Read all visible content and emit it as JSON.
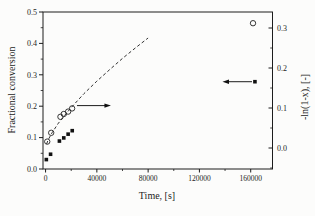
{
  "figure": {
    "x_axis_title": "Time, [s]",
    "left_axis_title": "Fractional conversion",
    "right_axis_title": "-ln(1-x), [-]"
  },
  "colors": {
    "ink": "#1c1c1c",
    "background": "#fcfcfb"
  },
  "chart_data": {
    "type": "scatter",
    "title": "",
    "xlabel": "Time, [s]",
    "ylabel_left": "Fractional conversion",
    "ylabel_right": "-ln(1-x), [-]",
    "grid": false,
    "legend": "none",
    "xlim": [
      -2000,
      177000
    ],
    "ylim_left": [
      0,
      0.5
    ],
    "ylim_right": [
      -0.0525,
      0.34
    ],
    "x_ticks": [
      0,
      40000,
      80000,
      120000,
      160000
    ],
    "x_tick_labels": [
      "0",
      "40000",
      "80000",
      "120000",
      "160000"
    ],
    "x_minor_ticks": [
      20000,
      60000,
      100000,
      140000
    ],
    "left_ticks": [
      0.0,
      0.1,
      0.2,
      0.3,
      0.4,
      0.5
    ],
    "left_tick_labels": [
      "0.0",
      "0.1",
      "0.2",
      "0.3",
      "0.4",
      "0.5"
    ],
    "left_minor_ticks": [
      0.05,
      0.15,
      0.25,
      0.35,
      0.45
    ],
    "right_ticks": [
      0.0,
      0.1,
      0.2,
      0.3
    ],
    "right_tick_labels": [
      "0.0",
      "0.1",
      "0.2",
      "0.3"
    ],
    "right_minor_ticks": [
      -0.05,
      0.05,
      0.15,
      0.25
    ],
    "series": [
      {
        "name": "fractional-conversion-squares",
        "marker": "filled-square",
        "axis": "left",
        "points": [
          [
            600,
            0.03
          ],
          [
            3900,
            0.047
          ],
          [
            10800,
            0.089
          ],
          [
            14200,
            0.099
          ],
          [
            17600,
            0.111
          ],
          [
            20800,
            0.122
          ],
          [
            163300,
            0.278
          ]
        ]
      },
      {
        "name": "minus-ln-one-minus-x-circles",
        "marker": "open-circle",
        "axis": "right",
        "points": [
          [
            1300,
            0.016
          ],
          [
            4400,
            0.038
          ],
          [
            11600,
            0.078
          ],
          [
            14200,
            0.085
          ],
          [
            17600,
            0.091
          ],
          [
            20700,
            0.099
          ],
          [
            161800,
            0.312
          ]
        ]
      }
    ],
    "fit_line": {
      "name": "dashed-model-fit",
      "style": "dashed",
      "axis": "right",
      "points": [
        [
          800,
          0.01
        ],
        [
          2000,
          0.02
        ],
        [
          5000,
          0.038
        ],
        [
          10000,
          0.062
        ],
        [
          15000,
          0.082
        ],
        [
          20000,
          0.101
        ],
        [
          30000,
          0.136
        ],
        [
          40000,
          0.167
        ],
        [
          50000,
          0.196
        ],
        [
          60000,
          0.224
        ],
        [
          70000,
          0.25
        ],
        [
          80000,
          0.275
        ]
      ]
    },
    "annotations": [
      {
        "type": "arrow",
        "name": "circles-read-right-axis",
        "axis": "right",
        "value": 0.106,
        "tail_t": 24500,
        "tip_t": 51000,
        "direction": "right"
      },
      {
        "type": "arrow",
        "name": "squares-read-left-axis",
        "axis": "left",
        "value": 0.278,
        "tail_t": 161000,
        "tip_t": 138000,
        "direction": "left"
      }
    ]
  }
}
